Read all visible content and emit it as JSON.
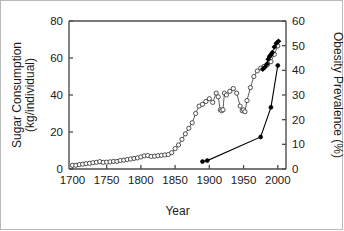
{
  "chart_data": {
    "type": "line",
    "title": "",
    "xlabel": "Year",
    "ylabel": "Sugar Consumption (kg/individual)",
    "ylabel_left_line1": "Sugar Consumption",
    "ylabel_left_line2": "(kg/individual)",
    "ylabel_right": "Obesity Prevalence (%)",
    "xlim": [
      1695,
      2012
    ],
    "ylim_left": [
      0,
      80
    ],
    "ylim_right": [
      0,
      60
    ],
    "xticks": [
      1700,
      1750,
      1800,
      1850,
      1900,
      1950,
      2000
    ],
    "yticks_left": [
      0,
      20,
      40,
      60,
      80
    ],
    "yticks_right": [
      0,
      10,
      20,
      30,
      40,
      50,
      60
    ],
    "grid": false,
    "legend": "none",
    "series": [
      {
        "name": "Sugar Consumption",
        "axis": "left",
        "marker": "open-circle",
        "color": "#333333",
        "units": "kg/individual",
        "points": [
          [
            1700,
            2.0
          ],
          [
            1705,
            2.0
          ],
          [
            1710,
            2.4
          ],
          [
            1715,
            2.6
          ],
          [
            1720,
            2.9
          ],
          [
            1725,
            3.1
          ],
          [
            1730,
            3.4
          ],
          [
            1735,
            3.6
          ],
          [
            1740,
            4.0
          ],
          [
            1745,
            3.6
          ],
          [
            1750,
            3.7
          ],
          [
            1755,
            3.9
          ],
          [
            1760,
            4.1
          ],
          [
            1765,
            4.1
          ],
          [
            1770,
            4.6
          ],
          [
            1775,
            4.8
          ],
          [
            1780,
            5.1
          ],
          [
            1785,
            5.4
          ],
          [
            1790,
            5.7
          ],
          [
            1795,
            6.0
          ],
          [
            1800,
            6.5
          ],
          [
            1805,
            7.1
          ],
          [
            1810,
            7.3
          ],
          [
            1815,
            6.8
          ],
          [
            1820,
            6.9
          ],
          [
            1825,
            7.2
          ],
          [
            1830,
            7.4
          ],
          [
            1835,
            7.6
          ],
          [
            1840,
            7.8
          ],
          [
            1845,
            8.8
          ],
          [
            1850,
            11.0
          ],
          [
            1855,
            13.0
          ],
          [
            1860,
            16.0
          ],
          [
            1865,
            19.0
          ],
          [
            1870,
            22.0
          ],
          [
            1875,
            25.0
          ],
          [
            1880,
            30.0
          ],
          [
            1885,
            34.0
          ],
          [
            1890,
            35.0
          ],
          [
            1895,
            36.5
          ],
          [
            1900,
            38.0
          ],
          [
            1905,
            36.0
          ],
          [
            1910,
            41.0
          ],
          [
            1913,
            39.0
          ],
          [
            1916,
            32.0
          ],
          [
            1918,
            31.5
          ],
          [
            1920,
            32.0
          ],
          [
            1922,
            41.0
          ],
          [
            1925,
            40.0
          ],
          [
            1930,
            42.0
          ],
          [
            1935,
            43.5
          ],
          [
            1940,
            41.0
          ],
          [
            1945,
            34.0
          ],
          [
            1948,
            31.5
          ],
          [
            1950,
            32.0
          ],
          [
            1952,
            31.0
          ],
          [
            1955,
            37.0
          ],
          [
            1960,
            44.0
          ],
          [
            1965,
            50.0
          ],
          [
            1970,
            53.0
          ],
          [
            1975,
            54.5
          ],
          [
            1980,
            55.5
          ],
          [
            1985,
            56.5
          ],
          [
            1990,
            58.0
          ],
          [
            1995,
            62.0
          ],
          [
            2000,
            66.5
          ]
        ]
      },
      {
        "name": "Obesity Prevalence",
        "axis": "right",
        "marker": "filled",
        "color": "#000000",
        "units": "%",
        "points": [
          [
            1890,
            3.0
          ],
          [
            1897,
            3.4
          ],
          [
            1975,
            13.0
          ],
          [
            1978,
            14.0
          ],
          [
            1980,
            40.5
          ],
          [
            1982,
            41.5
          ],
          [
            1985,
            43.0
          ],
          [
            1988,
            45.5
          ],
          [
            1990,
            46.0
          ],
          [
            1991,
            46.5
          ],
          [
            1994,
            48.0
          ],
          [
            1997,
            50.5
          ],
          [
            2000,
            51.5
          ],
          [
            1990,
            25.0
          ],
          [
            2000,
            42.0
          ]
        ],
        "lower_track": [
          [
            1890,
            3.0
          ],
          [
            1897,
            3.4
          ],
          [
            1975,
            13.0
          ],
          [
            1990,
            25.0
          ],
          [
            2000,
            42.0
          ]
        ],
        "upper_track": [
          [
            1978,
            40.5
          ],
          [
            1981,
            41.2
          ],
          [
            1984,
            42.5
          ],
          [
            1986,
            44.5
          ],
          [
            1988,
            45.5
          ],
          [
            1989,
            46.0
          ],
          [
            1990,
            46.3
          ],
          [
            1992,
            47.2
          ],
          [
            1995,
            49.5
          ],
          [
            1998,
            51.0
          ],
          [
            2001,
            51.8
          ]
        ]
      }
    ]
  }
}
